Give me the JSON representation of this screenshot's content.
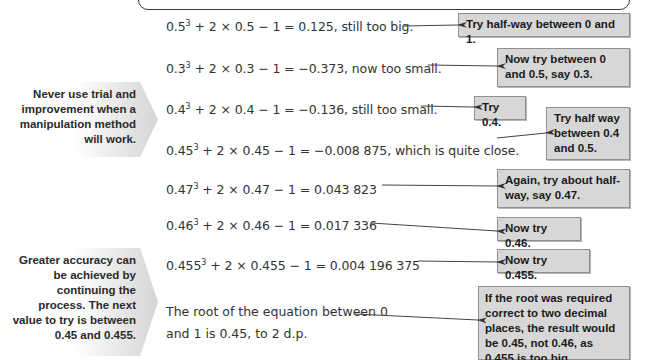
{
  "sidebar_notes": [
    {
      "text": "Never use trial and improvement when a manipulation method will work."
    },
    {
      "text": "Greater accuracy can be achieved by continuing the process. The next value to try is between 0.45 and 0.455."
    }
  ],
  "equations": [
    {
      "base": "0.5",
      "power": "3",
      "rest": " + 2 × 0.5 − 1 = 0.125, still too big."
    },
    {
      "base": "0.3",
      "power": "3",
      "rest": " + 2 × 0.3 − 1 = −0.373, now too small."
    },
    {
      "base": "0.4",
      "power": "3",
      "rest": " + 2 × 0.4 − 1 = −0.136, still too small."
    },
    {
      "base": "0.45",
      "power": "3",
      "rest": " + 2 × 0.45 − 1 = −0.008 875, which is quite close."
    },
    {
      "base": "0.47",
      "power": "3",
      "rest": " + 2 × 0.47 − 1 = 0.043 823"
    },
    {
      "base": "0.46",
      "power": "3",
      "rest": " + 2 × 0.46 − 1 = 0.017 336"
    },
    {
      "base": "0.455",
      "power": "3",
      "rest": " + 2 × 0.455 − 1 = 0.004 196 375"
    }
  ],
  "conclusion": "The root of the equation between 0 and 1 is 0.45, to 2 d.p.",
  "notes": [
    {
      "text": "Try half-way between 0 and 1."
    },
    {
      "text": "Now try between 0 and 0.5, say 0.3."
    },
    {
      "text": "Try 0.4."
    },
    {
      "text": "Try half way between 0.4 and 0.5."
    },
    {
      "text": "Again, try about half-way, say 0.47."
    },
    {
      "text": "Now try 0.46."
    },
    {
      "text": "Now try 0.455."
    },
    {
      "text": "If the root was required correct to two decimal places, the result would be 0.45, not 0.46, as 0.455 is too big."
    }
  ],
  "colors": {
    "note_bg": "#d7d7d7",
    "note_border": "#8f8f8f",
    "text": "#333333"
  }
}
